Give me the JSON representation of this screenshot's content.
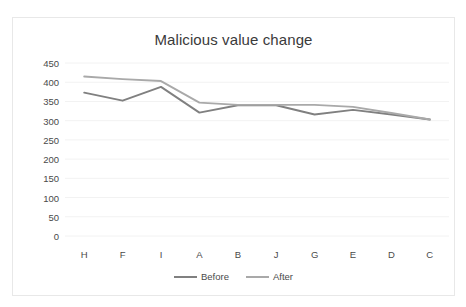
{
  "chart_data": {
    "type": "line",
    "title": "Malicious value change",
    "xlabel": "",
    "ylabel": "",
    "categories": [
      "H",
      "F",
      "I",
      "A",
      "B",
      "J",
      "G",
      "E",
      "D",
      "C"
    ],
    "series": [
      {
        "name": "Before",
        "color": "#808080",
        "values": [
          373,
          352,
          388,
          321,
          340,
          340,
          316,
          328,
          316,
          303
        ]
      },
      {
        "name": "After",
        "color": "#a9a9a9",
        "values": [
          415,
          408,
          403,
          347,
          341,
          341,
          341,
          336,
          320,
          303
        ]
      }
    ],
    "ylim": [
      0,
      450
    ],
    "yticks": [
      450,
      400,
      350,
      300,
      250,
      200,
      150,
      100,
      50,
      0
    ],
    "ytick_labels": [
      "450",
      "400",
      "350",
      "300",
      "250",
      "200",
      "150",
      "100",
      "50",
      "0"
    ],
    "grid": true,
    "grid_axis": "y",
    "grid_color": "#f2f2f2",
    "legend_position": "bottom",
    "legend_entries": [
      "Before",
      "After"
    ],
    "markers": false,
    "background": "#ffffff",
    "border_color": "#e8e8e8"
  }
}
